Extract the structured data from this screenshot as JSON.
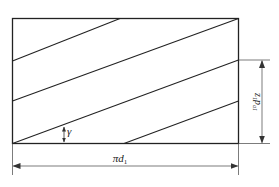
{
  "diagram": {
    "type": "helix-development",
    "labels": {
      "angle": "γ",
      "width": "πd",
      "width_sub": "1",
      "height_main": "z",
      "height_sub1": "1",
      "height_p": "p",
      "height_sub2": "a1"
    },
    "colors": {
      "line": "#222222",
      "dimension": "#444444",
      "background": "#ffffff"
    }
  }
}
